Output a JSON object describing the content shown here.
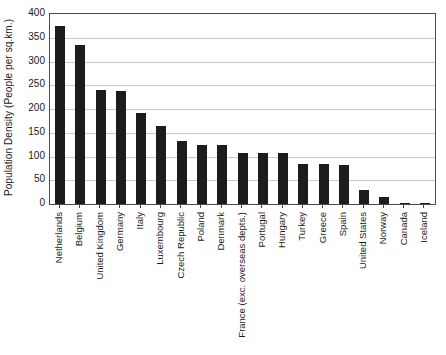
{
  "chart_data": {
    "type": "bar",
    "title": "",
    "xlabel": "",
    "ylabel": "Population Density (People per sq.km.)",
    "ylim": [
      0,
      400
    ],
    "yticks": [
      0,
      50,
      100,
      150,
      200,
      250,
      300,
      350,
      400
    ],
    "grid": true,
    "legend": "none",
    "bar_color": "#1c1c1c",
    "categories": [
      "Netherlands",
      "Belgium",
      "United Kingdom",
      "Germany",
      "Italy",
      "Luxembourg",
      "Czech Republic",
      "Poland",
      "Denmark",
      "France (exc. overseas depts.)",
      "Portugal",
      "Hungary",
      "Turkey",
      "Greece",
      "Spain",
      "United States",
      "Norway",
      "Canada",
      "Iceland"
    ],
    "values": [
      375,
      335,
      240,
      237,
      192,
      164,
      132,
      124,
      124,
      108,
      107,
      107,
      85,
      84,
      82,
      29,
      14,
      3,
      3
    ]
  }
}
